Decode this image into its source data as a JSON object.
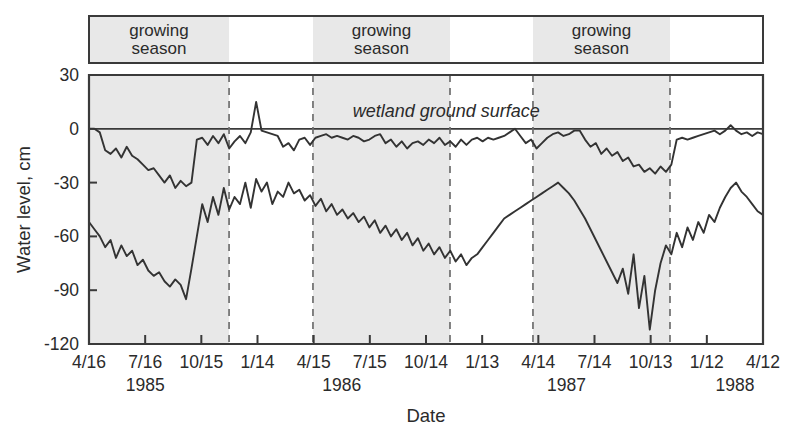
{
  "figure": {
    "ylabel": "Water level, cm",
    "xlabel": "Date",
    "annotation": "wetland ground surface",
    "banner_labels": [
      "growing season",
      "growing season",
      "growing season"
    ]
  },
  "chart_data": {
    "type": "line",
    "title": "",
    "xlabel": "Date",
    "ylabel": "Water level, cm",
    "ylim": [
      -120,
      30
    ],
    "yticks": [
      30,
      0,
      -30,
      -60,
      -90,
      -120
    ],
    "ytick_labels": [
      "30",
      "0",
      "-30",
      "-60",
      "-90",
      "-120"
    ],
    "xtick_labels": [
      "4/16",
      "7/16",
      "10/15",
      "1/14",
      "4/15",
      "7/15",
      "10/14",
      "1/13",
      "4/14",
      "7/14",
      "10/13",
      "1/12",
      "4/12"
    ],
    "year_labels": [
      "1985",
      "1986",
      "1987",
      "1988"
    ],
    "year_label_positions": [
      1.0,
      4.5,
      8.5,
      11.5
    ],
    "grid": false,
    "legend": false,
    "annotations": [
      {
        "text": "wetland ground surface",
        "y": 0,
        "x_frac": 0.53,
        "style": "italic"
      },
      {
        "text": "growing season",
        "band": 0
      },
      {
        "text": "growing season",
        "band": 1
      },
      {
        "text": "growing season",
        "band": 2
      }
    ],
    "shaded_bands": [
      {
        "label": "growing season",
        "x_start_frac": 0.0,
        "x_end_frac": 0.2078
      },
      {
        "label": "growing season",
        "x_start_frac": 0.3323,
        "x_end_frac": 0.5356
      },
      {
        "label": "growing season",
        "x_start_frac": 0.6587,
        "x_end_frac": 0.862
      }
    ],
    "divider_lines_frac": [
      0.2078,
      0.3323,
      0.5356,
      0.6587,
      0.862
    ],
    "ground_surface_level": 0,
    "series": [
      {
        "name": "shallow well water level",
        "color": "#333333",
        "x": [
          0.0,
          0.008,
          0.016,
          0.024,
          0.032,
          0.04,
          0.048,
          0.056,
          0.064,
          0.072,
          0.08,
          0.088,
          0.096,
          0.104,
          0.112,
          0.12,
          0.128,
          0.136,
          0.144,
          0.152,
          0.16,
          0.168,
          0.176,
          0.184,
          0.192,
          0.2,
          0.208,
          0.216,
          0.224,
          0.232,
          0.24,
          0.248,
          0.256,
          0.264,
          0.272,
          0.28,
          0.288,
          0.296,
          0.304,
          0.312,
          0.32,
          0.328,
          0.336,
          0.344,
          0.352,
          0.36,
          0.368,
          0.376,
          0.384,
          0.392,
          0.4,
          0.408,
          0.416,
          0.424,
          0.432,
          0.44,
          0.448,
          0.456,
          0.464,
          0.472,
          0.48,
          0.488,
          0.496,
          0.504,
          0.512,
          0.52,
          0.528,
          0.536,
          0.544,
          0.552,
          0.56,
          0.568,
          0.576,
          0.584,
          0.592,
          0.6,
          0.608,
          0.616,
          0.624,
          0.632,
          0.64,
          0.648,
          0.656,
          0.664,
          0.672,
          0.68,
          0.688,
          0.696,
          0.704,
          0.712,
          0.72,
          0.728,
          0.736,
          0.744,
          0.752,
          0.76,
          0.768,
          0.776,
          0.784,
          0.792,
          0.8,
          0.808,
          0.816,
          0.824,
          0.832,
          0.84,
          0.848,
          0.856,
          0.864,
          0.872,
          0.88,
          0.888,
          0.896,
          0.904,
          0.912,
          0.92,
          0.928,
          0.936,
          0.944,
          0.952,
          0.96,
          0.968,
          0.976,
          0.984,
          0.992,
          1.0
        ],
        "y": [
          0,
          0,
          -2,
          -12,
          -14,
          -11,
          -16,
          -10,
          -15,
          -17,
          -20,
          -23,
          -22,
          -26,
          -30,
          -26,
          -33,
          -29,
          -32,
          -30,
          -6,
          -5,
          -9,
          -4,
          -8,
          -3,
          -11,
          -7,
          -4,
          -8,
          -2,
          15,
          -1,
          -2,
          -3,
          -4,
          -10,
          -8,
          -12,
          -6,
          -5,
          -9,
          -5,
          -4,
          -3,
          -5,
          -4,
          -5,
          -6,
          -4,
          -5,
          -7,
          -6,
          -4,
          -3,
          -8,
          -6,
          -10,
          -7,
          -11,
          -8,
          -7,
          -9,
          -6,
          -8,
          -5,
          -9,
          -7,
          -10,
          -6,
          -9,
          -6,
          -5,
          -7,
          -5,
          -6,
          -5,
          -4,
          -2,
          0,
          -4,
          -8,
          -6,
          -11,
          -8,
          -5,
          -3,
          -2,
          -4,
          -3,
          -1,
          -1,
          -6,
          -10,
          -8,
          -14,
          -11,
          -15,
          -13,
          -18,
          -16,
          -21,
          -20,
          -24,
          -22,
          -25,
          -21,
          -24,
          -20,
          -6,
          -5,
          -6,
          -5,
          -4,
          -3,
          -2,
          -1,
          -3,
          -1,
          2,
          -1,
          -3,
          -2,
          -4,
          -2,
          -3
        ]
      },
      {
        "name": "deep well water level",
        "color": "#333333",
        "x": [
          0.0,
          0.008,
          0.016,
          0.024,
          0.032,
          0.04,
          0.048,
          0.056,
          0.064,
          0.072,
          0.08,
          0.088,
          0.096,
          0.104,
          0.112,
          0.12,
          0.128,
          0.136,
          0.144,
          0.152,
          0.16,
          0.168,
          0.176,
          0.184,
          0.192,
          0.2,
          0.208,
          0.216,
          0.224,
          0.232,
          0.24,
          0.248,
          0.256,
          0.264,
          0.272,
          0.28,
          0.288,
          0.296,
          0.304,
          0.312,
          0.32,
          0.328,
          0.336,
          0.344,
          0.352,
          0.36,
          0.368,
          0.376,
          0.384,
          0.392,
          0.4,
          0.408,
          0.416,
          0.424,
          0.432,
          0.44,
          0.448,
          0.456,
          0.464,
          0.472,
          0.48,
          0.488,
          0.496,
          0.504,
          0.512,
          0.52,
          0.528,
          0.536,
          0.544,
          0.552,
          0.56,
          0.568,
          0.576,
          0.584,
          0.592,
          0.6,
          0.608,
          0.616,
          0.624,
          0.632,
          0.64,
          0.648,
          0.656,
          0.664,
          0.672,
          0.68,
          0.688,
          0.696,
          0.704,
          0.712,
          0.72,
          0.728,
          0.736,
          0.744,
          0.752,
          0.76,
          0.768,
          0.776,
          0.784,
          0.792,
          0.8,
          0.808,
          0.816,
          0.824,
          0.832,
          0.84,
          0.848,
          0.856,
          0.864,
          0.872,
          0.88,
          0.888,
          0.896,
          0.904,
          0.912,
          0.92,
          0.928,
          0.936,
          0.944,
          0.952,
          0.96,
          0.968,
          0.976,
          0.984,
          0.992,
          1.0
        ],
        "y": [
          -52,
          -56,
          -60,
          -66,
          -62,
          -72,
          -65,
          -71,
          -68,
          -76,
          -73,
          -79,
          -82,
          -80,
          -85,
          -88,
          -84,
          -87,
          -95,
          -78,
          -60,
          -42,
          -52,
          -38,
          -48,
          -33,
          -45,
          -38,
          -42,
          -30,
          -44,
          -28,
          -35,
          -30,
          -42,
          -35,
          -38,
          -30,
          -36,
          -34,
          -40,
          -37,
          -43,
          -39,
          -46,
          -42,
          -48,
          -45,
          -50,
          -47,
          -52,
          -49,
          -55,
          -51,
          -58,
          -54,
          -60,
          -56,
          -62,
          -58,
          -65,
          -61,
          -68,
          -64,
          -70,
          -66,
          -72,
          -68,
          -74,
          -70,
          -76,
          -72,
          -70,
          -66,
          -62,
          -58,
          -54,
          -50,
          -48,
          -46,
          -44,
          -42,
          -40,
          -38,
          -36,
          -34,
          -32,
          -30,
          -33,
          -36,
          -40,
          -45,
          -50,
          -56,
          -62,
          -68,
          -74,
          -80,
          -86,
          -78,
          -92,
          -70,
          -100,
          -82,
          -112,
          -90,
          -75,
          -65,
          -70,
          -58,
          -66,
          -55,
          -62,
          -52,
          -58,
          -48,
          -52,
          -44,
          -38,
          -33,
          -30,
          -35,
          -38,
          -42,
          -46,
          -48
        ]
      }
    ]
  }
}
